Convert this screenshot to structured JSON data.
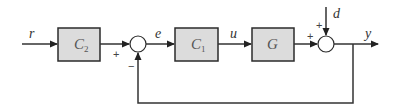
{
  "diagram": {
    "type": "feedback-control-block-diagram",
    "signals": {
      "reference": "r",
      "error": "e",
      "control": "u",
      "disturbance": "d",
      "output": "y"
    },
    "blocks": [
      {
        "id": "C2",
        "symbol": "C",
        "subscript": "2"
      },
      {
        "id": "C1",
        "symbol": "C",
        "subscript": "1"
      },
      {
        "id": "G",
        "symbol": "G",
        "subscript": ""
      }
    ],
    "junctions": [
      {
        "id": "sum-error",
        "inputs": [
          {
            "from": "C2",
            "sign": "+"
          },
          {
            "from": "y-feedback",
            "sign": "−"
          }
        ]
      },
      {
        "id": "sum-output",
        "inputs": [
          {
            "from": "G",
            "sign": "+"
          },
          {
            "from": "d",
            "sign": "+"
          }
        ]
      }
    ],
    "colors": {
      "block_fill": "#dcdcdc",
      "line": "#333333",
      "background": "#ffffff"
    }
  }
}
